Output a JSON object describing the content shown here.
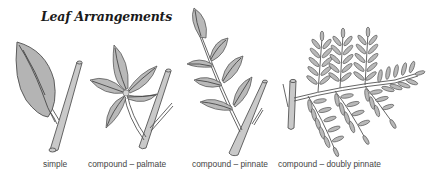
{
  "figure": {
    "title": "Leaf Arrangements",
    "colors": {
      "leaf_fill": "#b4b4b4",
      "stem_fill": "#c9c9c9",
      "outline": "#505050",
      "label_text": "#444444",
      "background": "#ffffff"
    },
    "panels": [
      {
        "id": "simple",
        "label": "simple",
        "icon": "simple-leaf-icon"
      },
      {
        "id": "palmate",
        "label": "compound – palmate",
        "icon": "palmate-leaf-icon"
      },
      {
        "id": "pinnate",
        "label": "compound – pinnate",
        "icon": "pinnate-leaf-icon"
      },
      {
        "id": "doubly-pinnate",
        "label": "compound – doubly pinnate",
        "icon": "doubly-pinnate-leaf-icon"
      }
    ]
  }
}
